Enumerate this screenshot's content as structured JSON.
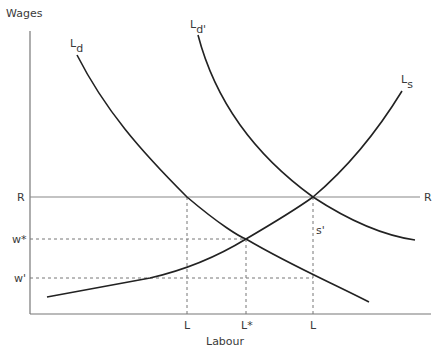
{
  "diagram": {
    "type": "labour market diagram",
    "axes": {
      "y_label": "Wages",
      "x_label": "Labour"
    },
    "y_ticks": [
      {
        "id": "R",
        "label": "R"
      },
      {
        "id": "w_star",
        "label": "w*"
      },
      {
        "id": "w_prime",
        "label": "w'"
      }
    ],
    "x_ticks": [
      {
        "id": "L1",
        "label": "L"
      },
      {
        "id": "L_star",
        "label": "L*"
      },
      {
        "id": "L2",
        "label": "L"
      }
    ],
    "curves": [
      {
        "id": "Ld",
        "main": "L",
        "sub": "d",
        "description": "Labour demand curve (downward sloping)"
      },
      {
        "id": "Ld_prime",
        "main": "L",
        "sub": "d'",
        "description": "Shifted labour demand curve"
      },
      {
        "id": "Ls",
        "main": "L",
        "sub": "s",
        "description": "Labour supply curve (upward sloping)"
      }
    ],
    "horizontal_line": {
      "label": "R",
      "description": "Reservation / minimum wage line"
    },
    "annotations": [
      {
        "id": "s_prime",
        "label": "s'"
      }
    ],
    "colors": {
      "curve": "#222222",
      "axis": "#777777",
      "dashed": "#777777",
      "text": "#3a3a3a"
    }
  }
}
